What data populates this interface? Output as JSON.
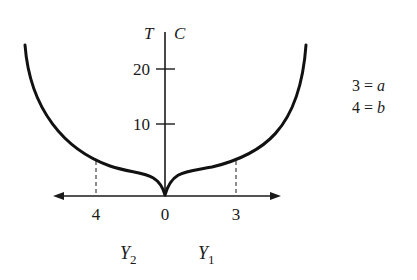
{
  "axes": {
    "vertical_label_left": "T",
    "vertical_label_right": "C",
    "y_ticks": [
      {
        "label": "20",
        "y": 69
      },
      {
        "label": "10",
        "y": 124
      }
    ],
    "x_ticks": [
      {
        "label": "4",
        "x": 96
      },
      {
        "label": "0",
        "x": 165
      },
      {
        "label": "3",
        "x": 236
      }
    ]
  },
  "region_labels": {
    "left": {
      "main": "Y",
      "sub": "2"
    },
    "right": {
      "main": "Y",
      "sub": "1"
    }
  },
  "legend": {
    "line1": {
      "num": "3 =",
      "var": "a"
    },
    "line2": {
      "num": "4 =",
      "var": "b"
    }
  },
  "colors": {
    "curve": "#111111",
    "axis": "#1a1a1a",
    "background": "#ffffff"
  }
}
